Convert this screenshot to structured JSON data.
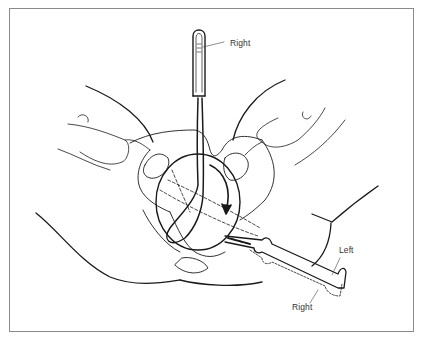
{
  "figure": {
    "labels": {
      "handle_label": "Right",
      "lower_handle_left": "Left",
      "lower_handle_right": "Right"
    },
    "colors": {
      "line": "#1a1a1a",
      "border": "#8a8a8a",
      "background": "#ffffff"
    }
  }
}
